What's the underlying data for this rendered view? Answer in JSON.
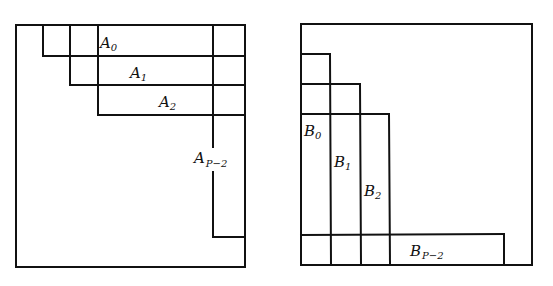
{
  "diagram": {
    "left_panel": {
      "name": "matrix-A-partition",
      "blocks": [
        {
          "base": "A",
          "sub": "0"
        },
        {
          "base": "A",
          "sub": "1"
        },
        {
          "base": "A",
          "sub": "2"
        },
        {
          "base": "A",
          "sub": "P−2"
        }
      ]
    },
    "right_panel": {
      "name": "matrix-B-partition",
      "blocks": [
        {
          "base": "B",
          "sub": "0"
        },
        {
          "base": "B",
          "sub": "1"
        },
        {
          "base": "B",
          "sub": "2"
        },
        {
          "base": "B",
          "sub": "P−2"
        }
      ]
    },
    "colors": {
      "stroke": "#111111",
      "background": "#ffffff"
    }
  }
}
